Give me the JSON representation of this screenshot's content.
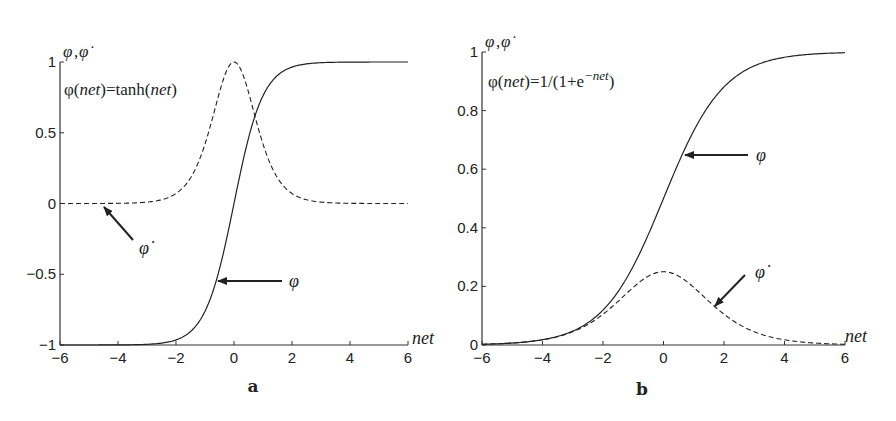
{
  "chart_data": [
    {
      "type": "line",
      "panel_label": "a",
      "title": "",
      "annotation": "φ(net)=tanh(net)",
      "xlabel": "net",
      "ylabel": "φ,φ̇",
      "xlim": [
        -6,
        6
      ],
      "ylim": [
        -1,
        1
      ],
      "xticks": [
        -6,
        -4,
        -2,
        0,
        2,
        4,
        6
      ],
      "yticks": [
        -1,
        -0.5,
        0,
        0.5,
        1
      ],
      "ytick_labels": [
        "−1",
        "−0.5",
        "0",
        "0.5",
        "1"
      ],
      "xtick_labels": [
        "−6",
        "−4",
        "−2",
        "0",
        "2",
        "4",
        "6"
      ],
      "grid": false,
      "series": [
        {
          "name": "φ",
          "style": "solid",
          "function": "tanh(net)",
          "x": [
            -6,
            -4,
            -3,
            -2,
            -1.5,
            -1,
            -0.5,
            0,
            0.5,
            1,
            1.5,
            2,
            3,
            4,
            6
          ],
          "values": [
            -1.0,
            -0.999,
            -0.995,
            -0.964,
            -0.905,
            -0.762,
            -0.462,
            0,
            0.462,
            0.762,
            0.905,
            0.964,
            0.995,
            0.999,
            1.0
          ]
        },
        {
          "name": "φ̇",
          "style": "dashed",
          "function": "1-tanh²(net)",
          "x": [
            -6,
            -4,
            -3,
            -2,
            -1.5,
            -1,
            -0.5,
            0,
            0.5,
            1,
            1.5,
            2,
            3,
            4,
            6
          ],
          "values": [
            0.0,
            0.001,
            0.01,
            0.071,
            0.181,
            0.42,
            0.786,
            1.0,
            0.786,
            0.42,
            0.181,
            0.071,
            0.01,
            0.001,
            0.0
          ]
        }
      ],
      "arrows": [
        {
          "label": "φ̇",
          "points_to": [
            -4.5,
            0
          ]
        },
        {
          "label": "φ",
          "points_to": [
            -0.55,
            -0.5
          ]
        }
      ]
    },
    {
      "type": "line",
      "panel_label": "b",
      "title": "",
      "annotation": "φ(net)=1/(1+e^(−net))",
      "xlabel": "net",
      "ylabel": "φ,φ̇",
      "xlim": [
        -6,
        6
      ],
      "ylim": [
        0,
        1
      ],
      "xticks": [
        -6,
        -4,
        -2,
        0,
        2,
        4,
        6
      ],
      "yticks": [
        0,
        0.2,
        0.4,
        0.6,
        0.8,
        1
      ],
      "ytick_labels": [
        "0",
        "0.2",
        "0.4",
        "0.6",
        "0.8",
        "1"
      ],
      "xtick_labels": [
        "−6",
        "−4",
        "−2",
        "0",
        "2",
        "4",
        "6"
      ],
      "grid": false,
      "series": [
        {
          "name": "φ",
          "style": "solid",
          "function": "1/(1+exp(-net))",
          "x": [
            -6,
            -4,
            -3,
            -2,
            -1,
            0,
            1,
            2,
            3,
            4,
            6
          ],
          "values": [
            0.002,
            0.018,
            0.047,
            0.119,
            0.269,
            0.5,
            0.731,
            0.881,
            0.953,
            0.982,
            0.998
          ]
        },
        {
          "name": "φ̇",
          "style": "dashed",
          "function": "φ(1-φ)",
          "x": [
            -6,
            -4,
            -3,
            -2,
            -1,
            0,
            1,
            2,
            3,
            4,
            6
          ],
          "values": [
            0.002,
            0.018,
            0.045,
            0.105,
            0.197,
            0.25,
            0.197,
            0.105,
            0.045,
            0.018,
            0.002
          ]
        }
      ],
      "arrows": [
        {
          "label": "φ",
          "points_to": [
            0.7,
            0.65
          ]
        },
        {
          "label": "φ̇",
          "points_to": [
            1.7,
            0.13
          ]
        }
      ]
    }
  ],
  "labels": {
    "phi": "φ",
    "phi_dot": "φ̇",
    "net": "net",
    "panel_a": "a",
    "panel_b": "b",
    "eq_a_prefix": "φ(",
    "eq_a_net1": "net",
    "eq_a_mid": ")=tanh(",
    "eq_a_net2": "net",
    "eq_a_suffix": ")",
    "eq_b_prefix": "φ(",
    "eq_b_net": "net",
    "eq_b_mid": ")=1/(1+e",
    "eq_b_exp": "−net",
    "eq_b_suffix": ")"
  }
}
